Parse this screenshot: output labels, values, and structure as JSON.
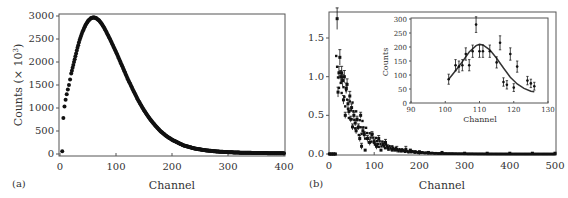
{
  "chart_data": [
    {
      "panel": "(a)",
      "type": "scatter",
      "title": "",
      "xlabel": "Channel",
      "ylabel": "Counts (× 10³)",
      "xlim": [
        0,
        400
      ],
      "ylim": [
        0,
        3000
      ],
      "xticks": [
        0,
        100,
        200,
        300,
        400
      ],
      "yticks": [
        0,
        500,
        1000,
        1500,
        2000,
        2500,
        3000
      ],
      "grid": false,
      "legend": null,
      "series": [
        {
          "name": "data",
          "x": [
            4,
            6,
            8,
            10,
            12,
            14,
            16,
            18,
            20,
            25,
            30,
            35,
            40,
            45,
            50,
            55,
            60,
            65,
            70,
            75,
            80,
            90,
            100,
            110,
            120,
            130,
            140,
            150,
            160,
            170,
            180,
            190,
            200,
            220,
            240,
            260,
            280,
            300,
            320,
            340,
            360,
            380,
            400
          ],
          "y": [
            60,
            780,
            1030,
            1180,
            1300,
            1400,
            1500,
            1620,
            1750,
            2000,
            2250,
            2480,
            2650,
            2790,
            2890,
            2950,
            2970,
            2950,
            2900,
            2820,
            2720,
            2480,
            2220,
            1940,
            1660,
            1400,
            1160,
            950,
            770,
            620,
            490,
            390,
            310,
            190,
            120,
            80,
            55,
            40,
            30,
            25,
            20,
            18,
            15
          ]
        }
      ]
    },
    {
      "panel": "(b)",
      "type": "scatter",
      "title": "",
      "xlabel": "Channel",
      "ylabel": "",
      "xlim": [
        0,
        500
      ],
      "ylim": [
        0,
        1.8
      ],
      "xticks": [
        0,
        100,
        200,
        300,
        400,
        500
      ],
      "yticks": [
        0.0,
        0.5,
        1.0,
        1.5
      ],
      "grid": false,
      "legend": null,
      "error_bars": true,
      "series": [
        {
          "name": "data",
          "x": [
            2,
            6,
            10,
            14,
            18,
            20,
            22,
            24,
            26,
            28,
            30,
            32,
            34,
            36,
            38,
            40,
            42,
            44,
            46,
            48,
            50,
            52,
            55,
            58,
            60,
            62,
            65,
            68,
            70,
            72,
            75,
            78,
            80,
            85,
            90,
            95,
            100,
            105,
            110,
            115,
            120,
            125,
            130,
            140,
            150,
            160,
            170,
            180,
            190,
            200,
            220,
            250,
            300,
            350,
            400,
            450,
            500
          ],
          "y": [
            0.0,
            0.0,
            0.0,
            0.0,
            1.75,
            0.8,
            1.05,
            1.25,
            1.0,
            1.05,
            0.95,
            0.7,
            1.0,
            0.5,
            0.85,
            0.9,
            0.65,
            0.55,
            0.75,
            0.45,
            0.6,
            0.35,
            0.5,
            0.4,
            0.3,
            0.45,
            0.35,
            0.2,
            0.5,
            0.1,
            0.3,
            0.25,
            0.05,
            0.2,
            0.15,
            0.25,
            0.15,
            0.1,
            0.2,
            0.05,
            0.12,
            0.15,
            0.08,
            0.05,
            0.06,
            0.04,
            0.06,
            0.05,
            0.03,
            0.03,
            0.02,
            0.02,
            0.01,
            0.01,
            0.01,
            0.01,
            0.01
          ]
        }
      ],
      "inset": {
        "type": "scatter+line",
        "xlabel": "Channel",
        "ylabel": "Counts",
        "xlim": [
          90,
          130
        ],
        "ylim": [
          0,
          300
        ],
        "xticks": [
          90,
          100,
          110,
          120,
          130
        ],
        "yticks": [
          0,
          50,
          100,
          150,
          200,
          250,
          300
        ],
        "series": [
          {
            "name": "data",
            "error_bars": true,
            "x": [
              101,
              103,
              104,
              105,
              106,
              107,
              108,
              109,
              110,
              111,
              113,
              115,
              116,
              117,
              118,
              119,
              120,
              121,
              124,
              125,
              126
            ],
            "y": [
              85,
              135,
              130,
              135,
              175,
              135,
              185,
              280,
              185,
              185,
              185,
              145,
              215,
              75,
              65,
              175,
              55,
              130,
              80,
              70,
              60
            ],
            "yerr": [
              18,
              20,
              20,
              20,
              22,
              20,
              22,
              28,
              22,
              22,
              22,
              20,
              25,
              15,
              15,
              22,
              14,
              20,
              15,
              15,
              14
            ]
          },
          {
            "name": "fit",
            "x": [
              101,
              103,
              105,
              107,
              109,
              110,
              111,
              113,
              115,
              117,
              119,
              121,
              123,
              125,
              126
            ],
            "y": [
              85,
              115,
              148,
              182,
              205,
              210,
              207,
              190,
              160,
              125,
              92,
              68,
              52,
              42,
              40
            ]
          }
        ]
      }
    }
  ],
  "labels": {
    "panel_a": "(a)",
    "panel_b": "(b)",
    "a_xlabel": "Channel",
    "a_ylabel": "Counts (× 10",
    "a_ylabel_sup": "3",
    "a_ylabel_end": ")",
    "b_xlabel": "Channel",
    "inset_xlabel": "Channel",
    "inset_ylabel": "Counts"
  },
  "colors": {
    "marker": "#111111",
    "axis": "#555555",
    "text": "#333333"
  }
}
